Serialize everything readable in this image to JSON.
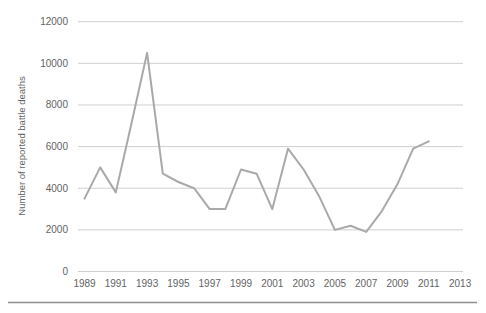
{
  "figure": {
    "y_axis_title": "Number of reported battle deaths"
  },
  "chart_data": {
    "type": "line",
    "title": "",
    "xlabel": "",
    "ylabel": "Number of reported battle deaths",
    "x": [
      1989,
      1990,
      1991,
      1992,
      1993,
      1994,
      1995,
      1996,
      1997,
      1998,
      1999,
      2000,
      2001,
      2002,
      2003,
      2004,
      2005,
      2006,
      2007,
      2008,
      2009,
      2010,
      2011
    ],
    "series": [
      {
        "name": "reported battle deaths",
        "values": [
          3500,
          5000,
          3800,
          7100,
          10500,
          4700,
          4300,
          4000,
          3000,
          3000,
          4900,
          4700,
          3000,
          5900,
          4900,
          3600,
          2000,
          2200,
          1900,
          2900,
          4200,
          5900,
          6250
        ]
      }
    ],
    "xticks": [
      1989,
      1991,
      1993,
      1995,
      1997,
      1999,
      2001,
      2003,
      2005,
      2007,
      2009,
      2011,
      2013
    ],
    "yticks": [
      0,
      2000,
      4000,
      6000,
      8000,
      10000,
      12000
    ],
    "ylim": [
      0,
      12000
    ],
    "xlim": [
      1989,
      2013
    ],
    "grid": true,
    "legend_position": "none",
    "line_color": "#a9a9a9",
    "grid_color": "#cfcfcf",
    "text_color": "#636363",
    "bottom_rule_color": "#8f8f8f"
  }
}
